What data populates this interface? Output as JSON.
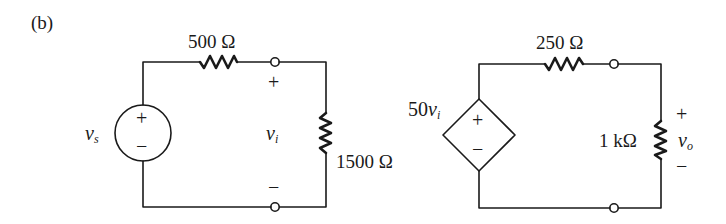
{
  "figure": {
    "panel_label": "(b)",
    "stroke_color": "#1a1a1a",
    "background": "#ffffff"
  },
  "input_circuit": {
    "source": {
      "type": "independent-voltage-source",
      "symbol": "v",
      "subscript": "s",
      "plus": "+",
      "minus": "−"
    },
    "series_resistor": {
      "label": "500 Ω"
    },
    "load_resistor": {
      "label": "1500 Ω"
    },
    "port_voltage": {
      "symbol": "v",
      "subscript": "i",
      "plus": "+",
      "minus": "−"
    }
  },
  "output_circuit": {
    "dependent_source": {
      "type": "voltage-controlled-voltage-source",
      "gain": "50",
      "symbol": "v",
      "subscript": "i",
      "plus": "+",
      "minus": "−"
    },
    "series_resistor": {
      "label": "250 Ω"
    },
    "load_resistor": {
      "label": "1 kΩ"
    },
    "output_voltage": {
      "symbol": "v",
      "subscript": "o",
      "plus": "+",
      "minus": "−"
    }
  }
}
